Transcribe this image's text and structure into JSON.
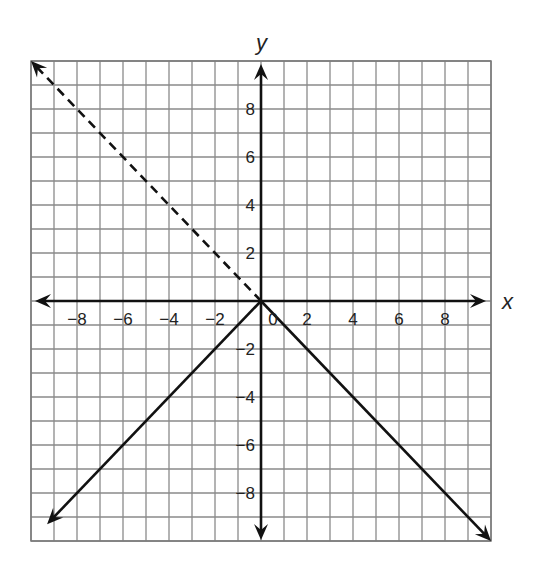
{
  "chart_data": {
    "type": "line",
    "title": "",
    "xlabel": "x",
    "ylabel": "y",
    "xlim": [
      -10,
      10
    ],
    "ylim": [
      -10,
      10
    ],
    "grid": true,
    "grid_step": 1,
    "x_ticks": [
      -8,
      -6,
      -4,
      -2,
      0,
      2,
      4,
      6,
      8
    ],
    "x_tick_labels": [
      "−8",
      "−6",
      "−4",
      "−2",
      "0",
      "2",
      "4",
      "6",
      "8"
    ],
    "y_ticks": [
      8,
      6,
      4,
      2,
      -2,
      -4,
      -6,
      -8
    ],
    "y_tick_labels": [
      "8",
      "6",
      "4",
      "2",
      "−2",
      "−4",
      "−6",
      "−8"
    ],
    "series": [
      {
        "name": "y = -|x| (left branch)",
        "style": "solid",
        "points": [
          [
            0,
            0
          ],
          [
            -9.3,
            -9.3
          ]
        ],
        "arrow_end": true
      },
      {
        "name": "y = -|x| (right branch)",
        "style": "solid",
        "points": [
          [
            0,
            0
          ],
          [
            10,
            -10
          ]
        ],
        "arrow_end": true
      },
      {
        "name": "y = -x (x<0 extension)",
        "style": "dashed",
        "points": [
          [
            0,
            0
          ],
          [
            -10,
            10
          ]
        ],
        "arrow_end": true
      }
    ],
    "legend": null
  },
  "labels": {
    "x_axis": "x",
    "y_axis": "y",
    "origin": "0"
  },
  "colors": {
    "line": "#111111",
    "grid": "#8a8a8a",
    "background": "#ffffff"
  }
}
